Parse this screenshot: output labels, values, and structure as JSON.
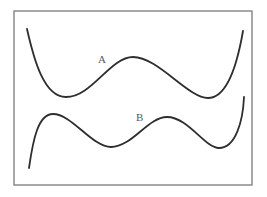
{
  "figure": {
    "width": 267,
    "height": 197,
    "frame": {
      "x": 14,
      "y": 11,
      "width": 238,
      "height": 174,
      "color": "#7a7a7a"
    },
    "curves": [
      {
        "name": "A",
        "label": "A",
        "label_pos": [
          98,
          63
        ],
        "color": "#2e2e2e",
        "path": "M27,29 C34,60 44,97 66,97 C92,97 110,57 133,57 C158,57 188,98 208,98 C228,98 238,60 243,31"
      },
      {
        "name": "B",
        "label": "B",
        "label_pos": [
          136,
          121
        ],
        "color": "#2e2e2e",
        "path": "M29,168 C33,140 38,114 53,114 C72,114 92,147 111,147 C132,147 148,117 167,117 C188,117 205,148 219,148 C236,148 243,120 244,97"
      }
    ]
  }
}
